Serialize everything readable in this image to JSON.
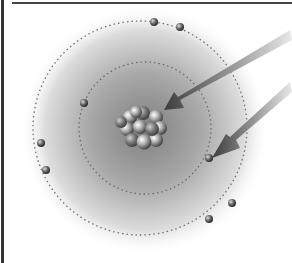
{
  "diagram": {
    "type": "bohr-atom-model",
    "colors": {
      "background": "#ffffff",
      "cloud_center": "#8a8a8a",
      "orbit": "#707070",
      "arrow": "#5a5a5a",
      "frame": "#333333"
    },
    "nucleus": {
      "cx": 145,
      "cy": 128,
      "label": ""
    },
    "orbits": [
      {
        "name": "inner-orbit",
        "cx": 145,
        "cy": 128,
        "r": 66
      },
      {
        "name": "outer-orbit",
        "cx": 140,
        "cy": 128,
        "r": 107
      }
    ],
    "electrons": [
      {
        "x": 154,
        "y": 22
      },
      {
        "x": 180,
        "y": 27
      },
      {
        "x": 84,
        "y": 103
      },
      {
        "x": 41,
        "y": 143
      },
      {
        "x": 46,
        "y": 170
      },
      {
        "x": 209,
        "y": 158
      },
      {
        "x": 232,
        "y": 203
      },
      {
        "x": 209,
        "y": 219
      }
    ],
    "arrows": [
      {
        "name": "nucleus-pointer-arrow",
        "target": "nucleus"
      },
      {
        "name": "electron-pointer-arrow",
        "target": "electron"
      }
    ]
  }
}
